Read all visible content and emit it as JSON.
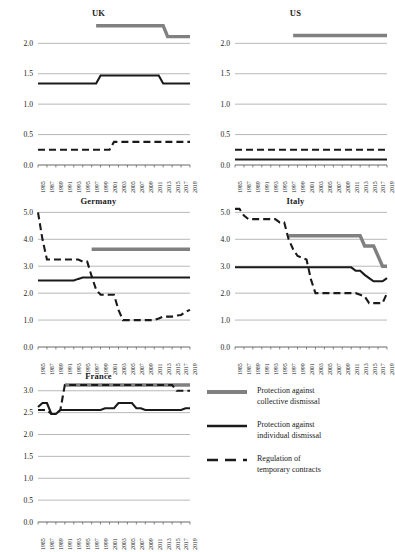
{
  "figure": {
    "background": "#ffffff",
    "series_colors": {
      "collective": "#808080",
      "individual": "#1a1a1a",
      "temporary": "#1a1a1a"
    }
  },
  "legend": {
    "position": "bottom-right",
    "items": [
      {
        "key": "collective",
        "style": "thick-grey-solid",
        "line1": "Protection against",
        "line2": "collective dismissal"
      },
      {
        "key": "individual",
        "style": "thick-black-solid",
        "line1": "Protection against",
        "line2": "individual dismissal"
      },
      {
        "key": "temporary",
        "style": "black-dashed",
        "line1": "Regulation of",
        "line2": "temporary contracts"
      }
    ]
  },
  "xticks": [
    "1985",
    "1987",
    "1989",
    "1991",
    "1993",
    "1995",
    "1997",
    "1999",
    "2001",
    "2003",
    "2005",
    "2007",
    "2009",
    "2011",
    "2013",
    "2015",
    "2017",
    "2019"
  ],
  "chart_data": [
    {
      "type": "line",
      "title": "UK",
      "xlabel": "",
      "ylabel": "",
      "xlim": [
        1985,
        2019
      ],
      "ylim": [
        0.0,
        2.4
      ],
      "yticks": [
        0.0,
        0.5,
        1.0,
        1.5,
        2.0
      ],
      "ytick_labels": [
        "0.0",
        "0.5",
        "1.0",
        "1.5",
        "2.0"
      ],
      "grid": true,
      "x": [
        1985,
        1986,
        1987,
        1988,
        1989,
        1990,
        1991,
        1992,
        1993,
        1994,
        1995,
        1996,
        1997,
        1998,
        1999,
        2000,
        2001,
        2002,
        2003,
        2004,
        2005,
        2006,
        2007,
        2008,
        2009,
        2010,
        2011,
        2012,
        2013,
        2014,
        2015,
        2016,
        2017,
        2018,
        2019
      ],
      "series": [
        {
          "name": "Protection against collective dismissal",
          "key": "collective",
          "values": [
            null,
            null,
            null,
            null,
            null,
            null,
            null,
            null,
            null,
            null,
            null,
            null,
            null,
            2.29,
            2.29,
            2.29,
            2.29,
            2.29,
            2.29,
            2.29,
            2.29,
            2.29,
            2.29,
            2.29,
            2.29,
            2.29,
            2.29,
            2.29,
            2.29,
            2.11,
            2.11,
            2.11,
            2.11,
            2.11,
            2.11
          ]
        },
        {
          "name": "Protection against individual dismissal",
          "key": "individual",
          "values": [
            1.34,
            1.34,
            1.34,
            1.34,
            1.34,
            1.34,
            1.34,
            1.34,
            1.34,
            1.34,
            1.34,
            1.34,
            1.34,
            1.34,
            1.47,
            1.47,
            1.47,
            1.47,
            1.47,
            1.47,
            1.47,
            1.47,
            1.47,
            1.47,
            1.47,
            1.47,
            1.47,
            1.47,
            1.34,
            1.34,
            1.34,
            1.34,
            1.34,
            1.34,
            1.34
          ]
        },
        {
          "name": "Regulation of temporary contracts",
          "key": "temporary",
          "values": [
            0.25,
            0.25,
            0.25,
            0.25,
            0.25,
            0.25,
            0.25,
            0.25,
            0.25,
            0.25,
            0.25,
            0.25,
            0.25,
            0.25,
            0.25,
            0.25,
            0.25,
            0.38,
            0.38,
            0.38,
            0.38,
            0.38,
            0.38,
            0.38,
            0.38,
            0.38,
            0.38,
            0.38,
            0.38,
            0.38,
            0.38,
            0.38,
            0.38,
            0.38,
            0.38
          ]
        }
      ]
    },
    {
      "type": "line",
      "title": "US",
      "xlabel": "",
      "ylabel": "",
      "xlim": [
        1985,
        2019
      ],
      "ylim": [
        0.0,
        2.4
      ],
      "yticks": [
        0.0,
        0.5,
        1.0,
        1.5,
        2.0
      ],
      "ytick_labels": [
        "0.0",
        "0.5",
        "1.0",
        "1.5",
        "2.0"
      ],
      "grid": true,
      "x": [
        1985,
        1986,
        1987,
        1988,
        1989,
        1990,
        1991,
        1992,
        1993,
        1994,
        1995,
        1996,
        1997,
        1998,
        1999,
        2000,
        2001,
        2002,
        2003,
        2004,
        2005,
        2006,
        2007,
        2008,
        2009,
        2010,
        2011,
        2012,
        2013,
        2014,
        2015,
        2016,
        2017,
        2018,
        2019
      ],
      "series": [
        {
          "name": "Protection against collective dismissal",
          "key": "collective",
          "values": [
            null,
            null,
            null,
            null,
            null,
            null,
            null,
            null,
            null,
            null,
            null,
            null,
            null,
            2.13,
            2.13,
            2.13,
            2.13,
            2.13,
            2.13,
            2.13,
            2.13,
            2.13,
            2.13,
            2.13,
            2.13,
            2.13,
            2.13,
            2.13,
            2.13,
            2.13,
            2.13,
            2.13,
            2.13,
            2.13,
            2.13
          ]
        },
        {
          "name": "Protection against individual dismissal",
          "key": "individual",
          "values": [
            0.09,
            0.09,
            0.09,
            0.09,
            0.09,
            0.09,
            0.09,
            0.09,
            0.09,
            0.09,
            0.09,
            0.09,
            0.09,
            0.09,
            0.09,
            0.09,
            0.09,
            0.09,
            0.09,
            0.09,
            0.09,
            0.09,
            0.09,
            0.09,
            0.09,
            0.09,
            0.09,
            0.09,
            0.09,
            0.09,
            0.09,
            0.09,
            0.09,
            0.09,
            0.09
          ]
        },
        {
          "name": "Regulation of temporary contracts",
          "key": "temporary",
          "values": [
            0.25,
            0.25,
            0.25,
            0.25,
            0.25,
            0.25,
            0.25,
            0.25,
            0.25,
            0.25,
            0.25,
            0.25,
            0.25,
            0.25,
            0.25,
            0.25,
            0.25,
            0.25,
            0.25,
            0.25,
            0.25,
            0.25,
            0.25,
            0.25,
            0.25,
            0.25,
            0.25,
            0.25,
            0.25,
            0.25,
            0.25,
            0.25,
            0.25,
            0.25,
            0.25
          ]
        }
      ]
    },
    {
      "type": "line",
      "title": "Germany",
      "xlabel": "",
      "ylabel": "",
      "xlim": [
        1985,
        2019
      ],
      "ylim": [
        0.0,
        5.2
      ],
      "yticks": [
        0.0,
        1.0,
        2.0,
        3.0,
        4.0,
        5.0
      ],
      "ytick_labels": [
        "0.0",
        "1.0",
        "2.0",
        "3.0",
        "4.0",
        "5.0"
      ],
      "grid": true,
      "x": [
        1985,
        1986,
        1987,
        1988,
        1989,
        1990,
        1991,
        1992,
        1993,
        1994,
        1995,
        1996,
        1997,
        1998,
        1999,
        2000,
        2001,
        2002,
        2003,
        2004,
        2005,
        2006,
        2007,
        2008,
        2009,
        2010,
        2011,
        2012,
        2013,
        2014,
        2015,
        2016,
        2017,
        2018,
        2019
      ],
      "series": [
        {
          "name": "Protection against collective dismissal",
          "key": "collective",
          "values": [
            null,
            null,
            null,
            null,
            null,
            null,
            null,
            null,
            null,
            null,
            null,
            null,
            3.63,
            3.63,
            3.63,
            3.63,
            3.63,
            3.63,
            3.63,
            3.63,
            3.63,
            3.63,
            3.63,
            3.63,
            3.63,
            3.63,
            3.63,
            3.63,
            3.63,
            3.63,
            3.63,
            3.63,
            3.63,
            3.63,
            3.63
          ]
        },
        {
          "name": "Protection against individual dismissal",
          "key": "individual",
          "values": [
            2.47,
            2.47,
            2.47,
            2.47,
            2.47,
            2.47,
            2.47,
            2.47,
            2.47,
            2.53,
            2.58,
            2.58,
            2.58,
            2.58,
            2.58,
            2.58,
            2.58,
            2.58,
            2.58,
            2.58,
            2.58,
            2.58,
            2.58,
            2.58,
            2.58,
            2.58,
            2.58,
            2.58,
            2.58,
            2.58,
            2.58,
            2.58,
            2.58,
            2.58,
            2.58
          ]
        },
        {
          "name": "Regulation of temporary contracts",
          "key": "temporary",
          "values": [
            5.0,
            4.0,
            3.25,
            3.25,
            3.25,
            3.25,
            3.25,
            3.25,
            3.25,
            3.25,
            3.17,
            3.17,
            2.63,
            2.13,
            1.94,
            1.94,
            1.94,
            1.94,
            1.38,
            1.0,
            1.0,
            1.0,
            1.0,
            1.0,
            1.0,
            1.0,
            1.0,
            1.06,
            1.13,
            1.13,
            1.13,
            1.17,
            1.19,
            1.31,
            1.38
          ]
        }
      ]
    },
    {
      "type": "line",
      "title": "Italy",
      "xlabel": "",
      "ylabel": "",
      "xlim": [
        1985,
        2019
      ],
      "ylim": [
        0.0,
        5.2
      ],
      "yticks": [
        0.0,
        1.0,
        2.0,
        3.0,
        4.0,
        5.0
      ],
      "ytick_labels": [
        "0.0",
        "1.0",
        "2.0",
        "3.0",
        "4.0",
        "5.0"
      ],
      "grid": true,
      "x": [
        1985,
        1986,
        1987,
        1988,
        1989,
        1990,
        1991,
        1992,
        1993,
        1994,
        1995,
        1996,
        1997,
        1998,
        1999,
        2000,
        2001,
        2002,
        2003,
        2004,
        2005,
        2006,
        2007,
        2008,
        2009,
        2010,
        2011,
        2012,
        2013,
        2014,
        2015,
        2016,
        2017,
        2018,
        2019
      ],
      "series": [
        {
          "name": "Protection against collective dismissal",
          "key": "collective",
          "values": [
            null,
            null,
            null,
            null,
            null,
            null,
            null,
            null,
            null,
            null,
            null,
            null,
            4.13,
            4.13,
            4.13,
            4.13,
            4.13,
            4.13,
            4.13,
            4.13,
            4.13,
            4.13,
            4.13,
            4.13,
            4.13,
            4.13,
            4.13,
            4.13,
            4.13,
            3.75,
            3.75,
            3.75,
            3.38,
            3.0,
            3.0
          ]
        },
        {
          "name": "Protection against individual dismissal",
          "key": "individual",
          "values": [
            2.96,
            2.96,
            2.96,
            2.96,
            2.96,
            2.96,
            2.96,
            2.96,
            2.96,
            2.96,
            2.96,
            2.96,
            2.96,
            2.96,
            2.96,
            2.96,
            2.96,
            2.96,
            2.96,
            2.96,
            2.96,
            2.96,
            2.96,
            2.96,
            2.96,
            2.96,
            2.96,
            2.83,
            2.83,
            2.68,
            2.56,
            2.44,
            2.44,
            2.44,
            2.56
          ]
        },
        {
          "name": "Regulation of temporary contracts",
          "key": "temporary",
          "values": [
            5.13,
            5.13,
            4.88,
            4.75,
            4.75,
            4.75,
            4.75,
            4.75,
            4.75,
            4.75,
            4.63,
            4.63,
            4.0,
            3.63,
            3.38,
            3.31,
            3.25,
            2.5,
            2.0,
            2.0,
            2.0,
            2.0,
            2.0,
            2.0,
            2.0,
            2.0,
            2.0,
            2.0,
            1.94,
            1.88,
            1.63,
            1.63,
            1.63,
            1.63,
            2.0
          ]
        }
      ]
    },
    {
      "type": "line",
      "title": "France",
      "xlabel": "",
      "ylabel": "",
      "xlim": [
        1985,
        2019
      ],
      "ylim": [
        0.0,
        3.2
      ],
      "yticks": [
        0.0,
        0.5,
        1.0,
        1.5,
        2.0,
        2.5,
        3.0
      ],
      "ytick_labels": [
        "0.0",
        "0.5",
        "1.0",
        "1.5",
        "2.0",
        "2.5",
        "3.0"
      ],
      "grid": true,
      "x": [
        1985,
        1986,
        1987,
        1988,
        1989,
        1990,
        1991,
        1992,
        1993,
        1994,
        1995,
        1996,
        1997,
        1998,
        1999,
        2000,
        2001,
        2002,
        2003,
        2004,
        2005,
        2006,
        2007,
        2008,
        2009,
        2010,
        2011,
        2012,
        2013,
        2014,
        2015,
        2016,
        2017,
        2018,
        2019
      ],
      "series": [
        {
          "name": "Protection against collective dismissal",
          "key": "collective",
          "values": [
            null,
            null,
            null,
            null,
            null,
            null,
            3.13,
            3.13,
            3.13,
            3.13,
            3.13,
            3.13,
            3.13,
            3.13,
            3.13,
            3.13,
            3.13,
            3.13,
            3.13,
            3.13,
            3.13,
            3.13,
            3.13,
            3.13,
            3.13,
            3.13,
            3.13,
            3.13,
            3.13,
            3.13,
            3.13,
            3.13,
            3.13,
            3.13,
            3.13
          ]
        },
        {
          "name": "Protection against individual dismissal",
          "key": "individual",
          "values": [
            2.63,
            2.72,
            2.72,
            2.47,
            2.47,
            2.56,
            2.56,
            2.56,
            2.56,
            2.56,
            2.56,
            2.56,
            2.56,
            2.56,
            2.56,
            2.6,
            2.6,
            2.6,
            2.72,
            2.72,
            2.72,
            2.72,
            2.6,
            2.6,
            2.56,
            2.56,
            2.56,
            2.56,
            2.56,
            2.56,
            2.56,
            2.56,
            2.56,
            2.6,
            2.6
          ]
        },
        {
          "name": "Regulation of temporary contracts",
          "key": "temporary",
          "values": [
            2.56,
            2.56,
            2.56,
            2.47,
            2.47,
            2.56,
            3.13,
            3.13,
            3.13,
            3.13,
            3.13,
            3.13,
            3.13,
            3.13,
            3.13,
            3.13,
            3.13,
            3.13,
            3.13,
            3.13,
            3.13,
            3.13,
            3.13,
            3.13,
            3.13,
            3.13,
            3.13,
            3.13,
            3.13,
            3.13,
            3.13,
            3.0,
            3.0,
            3.0,
            3.0
          ]
        }
      ]
    }
  ]
}
